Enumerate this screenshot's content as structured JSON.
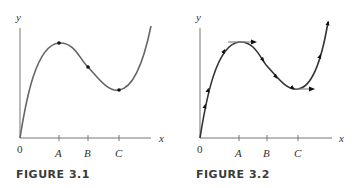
{
  "figures": [
    {
      "caption": "FIGURE 3.1",
      "axis_labels": {
        "x": "x",
        "y": "y",
        "origin": "0"
      },
      "ticks": [
        "A",
        "B",
        "C"
      ],
      "description": "Curve rising from origin to a local maximum at A, inflection point at B, local minimum at C, then rising again; dots mark A, B, C points on the curve"
    },
    {
      "caption": "FIGURE 3.2",
      "axis_labels": {
        "x": "x",
        "y": "y",
        "origin": "0"
      },
      "ticks": [
        "A",
        "B",
        "C"
      ],
      "description": "Same curve with arrowheads along it showing direction of motion, and horizontal tangent arrows at the maximum (A) and minimum (C)"
    }
  ]
}
